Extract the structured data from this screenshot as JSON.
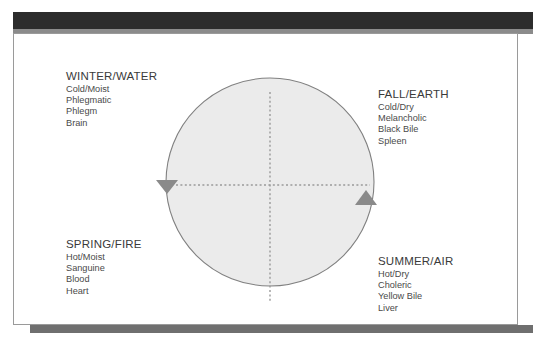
{
  "figure": {
    "title_bar_color": "#2c2c2c",
    "accent_gray": "#8b8b8b",
    "circle_fill": "#ebebeb",
    "circle_stroke": "#808080",
    "axis_color": "#9a9a9a",
    "arrow_color": "#8a8a8a"
  },
  "quadrants": [
    {
      "id": "winter-water",
      "title": "WINTER/WATER",
      "lines": [
        "Cold/Moist",
        "Phlegmatic",
        "Phlegm",
        "Brain"
      ]
    },
    {
      "id": "fall-earth",
      "title": "FALL/EARTH",
      "lines": [
        "Cold/Dry",
        "Melancholic",
        "Black Bile",
        "Spleen"
      ]
    },
    {
      "id": "spring-fire",
      "title": "SPRING/FIRE",
      "lines": [
        "Hot/Moist",
        "Sanguine",
        "Blood",
        "Heart"
      ]
    },
    {
      "id": "summer-air",
      "title": "SUMMER/AIR",
      "lines": [
        "Hot/Dry",
        "Choleric",
        "Yellow Bile",
        "Liver"
      ]
    }
  ]
}
